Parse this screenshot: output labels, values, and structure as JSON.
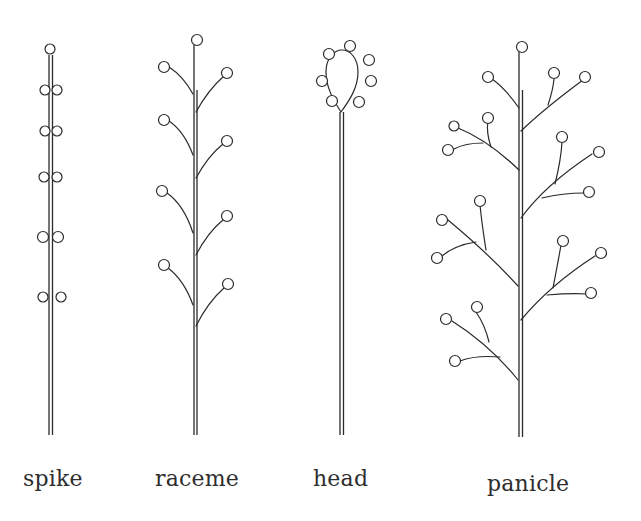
{
  "diagram": {
    "line_color": "#2a2a2a",
    "background": "#ffffff",
    "types": [
      {
        "id": "spike",
        "label": "spike",
        "description": "Sessile flowers attached directly along an unbranched axis"
      },
      {
        "id": "raceme",
        "label": "raceme",
        "description": "Stalked flowers alternating along an unbranched axis"
      },
      {
        "id": "head",
        "label": "head",
        "description": "Flowers clustered on a rounded receptacle at the stem tip"
      },
      {
        "id": "panicle",
        "label": "panicle",
        "description": "Branched axis with secondary branches bearing stalked flowers"
      }
    ]
  }
}
